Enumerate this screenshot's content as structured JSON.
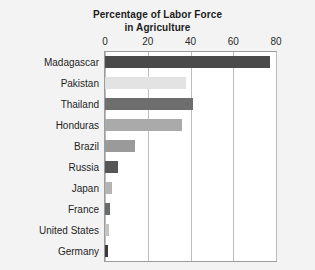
{
  "chart_data": {
    "type": "bar",
    "orientation": "horizontal",
    "title": "Percentage of Labor Force in Agriculture",
    "title_lines": [
      "Percentage of Labor Force",
      "in Agriculture"
    ],
    "xlabel": "",
    "ylabel": "",
    "xlim": [
      0,
      80
    ],
    "xticks": [
      0,
      20,
      40,
      60,
      80
    ],
    "xtick_labels": [
      "0",
      "20",
      "40",
      "60",
      "80"
    ],
    "grid": "vertical",
    "legend": "none",
    "categories": [
      "Madagascar",
      "Pakistan",
      "Thailand",
      "Honduras",
      "Brazil",
      "Russia",
      "Japan",
      "France",
      "United States",
      "Germany"
    ],
    "values": [
      77,
      38,
      41,
      36,
      14,
      6,
      3.5,
      2.5,
      2,
      1.5
    ],
    "bar_colors": [
      "#4a4a4a",
      "#e3e3e3",
      "#6e6e6e",
      "#aaaaaa",
      "#9a9a9a",
      "#565656",
      "#b4b4b4",
      "#6a6a6a",
      "#c4c4c4",
      "#3b3b3b"
    ]
  },
  "figure": {
    "background_color": "#f3f3f3",
    "plot_background_color": "#ffffff",
    "border_color": "#9c9c9c",
    "gridline_color": "#bdbdbd",
    "text_color": "#1f1f1f"
  }
}
